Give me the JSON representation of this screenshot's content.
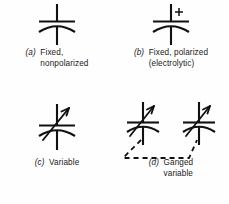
{
  "figure": {
    "background_color": "#fefefe",
    "ink_color": "#111111"
  },
  "panels": [
    {
      "id": "a",
      "label": "(a)",
      "caption": "Fixed,\nnonpolarized",
      "symbol": "capacitor-fixed-nonpolarized",
      "has_plus_sign": false,
      "has_arrow": false,
      "ganged": false
    },
    {
      "id": "b",
      "label": "(b)",
      "caption": "Fixed, polarized\n(electrolytic)",
      "symbol": "capacitor-fixed-polarized",
      "has_plus_sign": true,
      "plus_sign": "+",
      "has_arrow": false,
      "ganged": false
    },
    {
      "id": "c",
      "label": "(c)",
      "caption": "Variable",
      "symbol": "capacitor-variable",
      "has_plus_sign": false,
      "has_arrow": true,
      "ganged": false
    },
    {
      "id": "d",
      "label": "(d)",
      "caption": "Ganged\nvariable",
      "symbol": "capacitor-ganged-variable",
      "has_plus_sign": false,
      "has_arrow": true,
      "ganged": true,
      "ganging_line_style": "dashed",
      "symbol_count": 2
    }
  ]
}
